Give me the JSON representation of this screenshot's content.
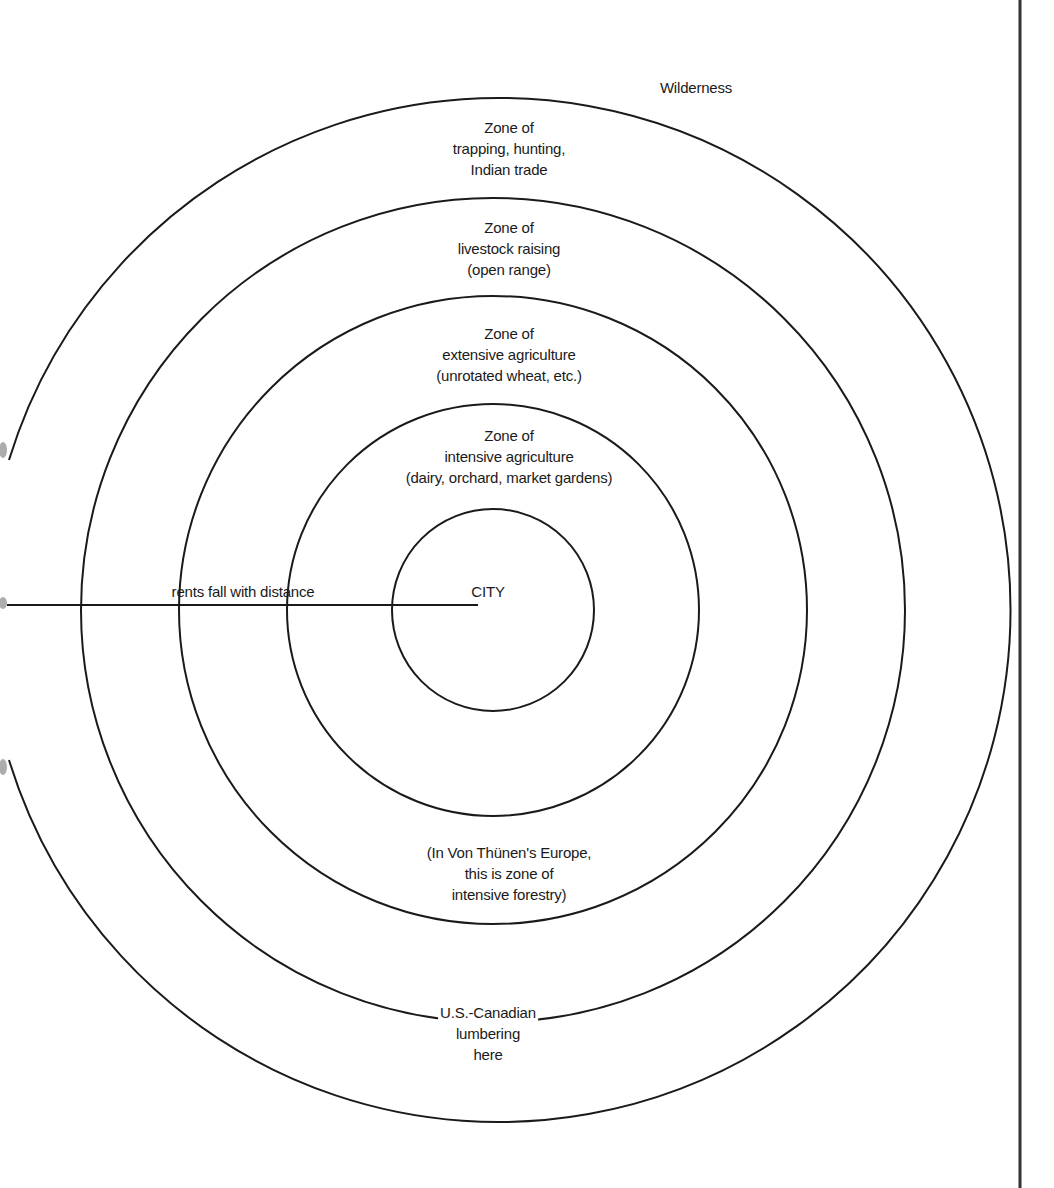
{
  "diagram": {
    "center": {
      "x": 493,
      "y": 593
    },
    "stroke_color": "#1a1a1a",
    "rings": [
      {
        "name": "city",
        "radius": 101
      },
      {
        "name": "intensive-agriculture",
        "radius": 206
      },
      {
        "name": "extensive-agriculture",
        "radius": 314
      },
      {
        "name": "livestock-raising",
        "radius": 412
      },
      {
        "name": "trapping-hunting",
        "radius": 512
      }
    ],
    "axis_line": {
      "x1": 7,
      "x2": 478,
      "y": 593
    },
    "right_border_x": 1020
  },
  "labels": {
    "wilderness": "Wilderness",
    "trapping_zone": [
      "Zone of",
      "trapping, hunting,",
      "Indian trade"
    ],
    "livestock_zone": [
      "Zone of",
      "livestock raising",
      "(open range)"
    ],
    "extensive_zone": [
      "Zone of",
      "extensive agriculture",
      "(unrotated wheat, etc.)"
    ],
    "intensive_zone": [
      "Zone of",
      "intensive agriculture",
      "(dairy, orchard, market gardens)"
    ],
    "city": "CITY",
    "rents_axis": "rents fall with distance",
    "forestry_note": [
      "(In Von Thünen's Europe,",
      "this is zone of",
      "intensive forestry)"
    ],
    "lumbering": [
      "U.S.-Canadian",
      "lumbering",
      "here"
    ]
  }
}
